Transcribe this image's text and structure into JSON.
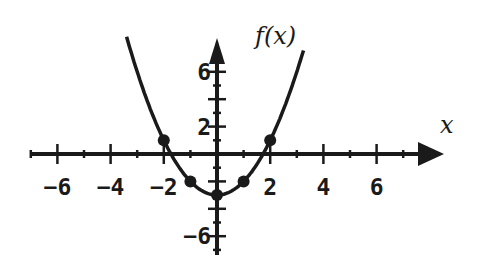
{
  "chart_data": {
    "type": "line",
    "title": "",
    "xlabel": "x",
    "ylabel": "f(x)",
    "function": "f(x) = x^2 - 3",
    "xlim": [
      -7.5,
      7.5
    ],
    "ylim": [
      -7.5,
      8.5
    ],
    "grid": false,
    "x_tick_labels": [
      "-6",
      "-4",
      "-2",
      "2",
      "4",
      "6"
    ],
    "x_tick_values": [
      -6,
      -4,
      -2,
      2,
      4,
      6
    ],
    "y_tick_labels": [
      "6",
      "2",
      "-6"
    ],
    "y_tick_values": [
      6,
      2,
      -6
    ],
    "curve_x_range": [
      -3.4,
      3.25
    ],
    "points": [
      {
        "x": -2,
        "y": 1
      },
      {
        "x": -1,
        "y": -2
      },
      {
        "x": 0,
        "y": -3
      },
      {
        "x": 1,
        "y": -2
      },
      {
        "x": 2,
        "y": 1
      }
    ]
  },
  "labels": {
    "y_axis": "f(x)",
    "x_axis": "x"
  },
  "colors": {
    "ink": "#1a1a1a",
    "background": "#ffffff"
  }
}
